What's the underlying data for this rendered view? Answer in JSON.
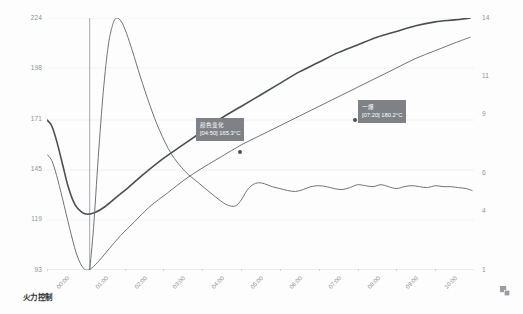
{
  "caption": "火力控制",
  "corner_icon": "expand-icon",
  "annotations": [
    {
      "name": "color-change",
      "title": "颜色变化",
      "value": "[04:50] 165.3°C",
      "time": "04:50",
      "temp_c": 165.3,
      "x_px": 196,
      "y_px": 118,
      "dot_x_px": 240,
      "dot_y_px": 152
    },
    {
      "name": "first-crack",
      "title": "一爆",
      "value": "[07:20] 180.2°C",
      "time": "07:20",
      "temp_c": 180.2,
      "x_px": 358,
      "y_px": 100,
      "dot_x_px": 355,
      "dot_y_px": 120
    }
  ],
  "colors": {
    "background": "#fdfdfd",
    "grid": "#ececec",
    "axis_text": "#8d9196",
    "tooltip_bg": "#7e8287",
    "tooltip_text": "#ffffff",
    "series_env": "#4b4f54",
    "series_bean": "#6f7479",
    "series_ror": "#6f7479",
    "marker": "#4b4f54"
  },
  "chart_data": {
    "type": "line",
    "title": "",
    "subtitle": "",
    "xlabel": "",
    "ylabel": "",
    "grid": true,
    "legend_position": "none",
    "x_ticks": [
      "00:00",
      "01:00",
      "02:00",
      "03:00",
      "04:00",
      "05:00",
      "06:00",
      "07:00",
      "08:00",
      "09:00",
      "10:00"
    ],
    "x_range_minutes": [
      0,
      11
    ],
    "y_left_ticks": [
      93,
      119,
      145,
      171,
      198,
      224
    ],
    "y_left_label": "温度 (°C)",
    "y_left_range": [
      93,
      224
    ],
    "y_right_ticks": [
      1,
      4,
      6,
      9,
      11,
      14
    ],
    "y_right_label": "升温速率 (°C/min)",
    "y_right_range": [
      1,
      14
    ],
    "series": [
      {
        "name": "环境温度",
        "axis": "left",
        "color": "#4b4f54",
        "width": 1.6,
        "points": [
          [
            0.0,
            171
          ],
          [
            0.12,
            168
          ],
          [
            0.25,
            160
          ],
          [
            0.4,
            148
          ],
          [
            0.55,
            136
          ],
          [
            0.72,
            127
          ],
          [
            0.9,
            123
          ],
          [
            1.05,
            122
          ],
          [
            1.25,
            123
          ],
          [
            1.5,
            126
          ],
          [
            1.8,
            131
          ],
          [
            2.1,
            136
          ],
          [
            2.5,
            143
          ],
          [
            3.0,
            151
          ],
          [
            3.5,
            158
          ],
          [
            4.0,
            165
          ],
          [
            4.5,
            172
          ],
          [
            5.0,
            178
          ],
          [
            5.5,
            184
          ],
          [
            6.0,
            190
          ],
          [
            6.5,
            196
          ],
          [
            7.0,
            201
          ],
          [
            7.5,
            206
          ],
          [
            8.0,
            210
          ],
          [
            8.5,
            214
          ],
          [
            9.0,
            217
          ],
          [
            9.5,
            220
          ],
          [
            10.0,
            222
          ],
          [
            10.5,
            223
          ],
          [
            10.9,
            224
          ]
        ]
      },
      {
        "name": "豆温",
        "axis": "left",
        "color": "#6f7479",
        "width": 1.0,
        "points": [
          [
            0.0,
            153
          ],
          [
            0.12,
            150
          ],
          [
            0.25,
            142
          ],
          [
            0.4,
            130
          ],
          [
            0.58,
            115
          ],
          [
            0.75,
            102
          ],
          [
            0.9,
            95
          ],
          [
            1.02,
            93
          ],
          [
            1.15,
            94
          ],
          [
            1.35,
            98
          ],
          [
            1.6,
            104
          ],
          [
            1.9,
            111
          ],
          [
            2.25,
            118
          ],
          [
            2.65,
            126
          ],
          [
            3.1,
            133
          ],
          [
            3.55,
            140
          ],
          [
            4.0,
            146
          ],
          [
            4.5,
            152
          ],
          [
            5.0,
            158
          ],
          [
            5.5,
            163
          ],
          [
            6.0,
            168
          ],
          [
            6.5,
            173
          ],
          [
            7.0,
            178
          ],
          [
            7.5,
            183
          ],
          [
            8.0,
            188
          ],
          [
            8.5,
            193
          ],
          [
            9.0,
            198
          ],
          [
            9.5,
            203
          ],
          [
            10.0,
            207
          ],
          [
            10.5,
            211
          ],
          [
            10.9,
            214
          ]
        ]
      },
      {
        "name": "升温速率",
        "axis": "right",
        "color": "#6f7479",
        "width": 1.0,
        "points": [
          [
            1.1,
            1.0
          ],
          [
            1.2,
            3.2
          ],
          [
            1.32,
            6.8
          ],
          [
            1.45,
            10.2
          ],
          [
            1.58,
            12.6
          ],
          [
            1.7,
            13.7
          ],
          [
            1.8,
            14.0
          ],
          [
            1.92,
            13.8
          ],
          [
            2.05,
            13.2
          ],
          [
            2.2,
            12.3
          ],
          [
            2.4,
            11.0
          ],
          [
            2.65,
            9.5
          ],
          [
            2.9,
            8.2
          ],
          [
            3.2,
            7.0
          ],
          [
            3.55,
            6.1
          ],
          [
            3.9,
            5.5
          ],
          [
            4.2,
            5.0
          ],
          [
            4.45,
            4.6
          ],
          [
            4.65,
            4.35
          ],
          [
            4.85,
            4.3
          ],
          [
            5.0,
            4.6
          ],
          [
            5.15,
            5.1
          ],
          [
            5.3,
            5.4
          ],
          [
            5.45,
            5.5
          ],
          [
            5.6,
            5.45
          ],
          [
            5.8,
            5.3
          ],
          [
            6.0,
            5.2
          ],
          [
            6.2,
            5.1
          ],
          [
            6.4,
            5.05
          ],
          [
            6.6,
            5.15
          ],
          [
            6.8,
            5.3
          ],
          [
            7.0,
            5.35
          ],
          [
            7.2,
            5.3
          ],
          [
            7.4,
            5.2
          ],
          [
            7.6,
            5.15
          ],
          [
            7.8,
            5.25
          ],
          [
            8.0,
            5.4
          ],
          [
            8.2,
            5.35
          ],
          [
            8.4,
            5.3
          ],
          [
            8.6,
            5.4
          ],
          [
            8.8,
            5.3
          ],
          [
            9.0,
            5.2
          ],
          [
            9.2,
            5.3
          ],
          [
            9.4,
            5.35
          ],
          [
            9.6,
            5.3
          ],
          [
            9.8,
            5.25
          ],
          [
            10.0,
            5.35
          ],
          [
            10.2,
            5.3
          ],
          [
            10.4,
            5.3
          ],
          [
            10.6,
            5.25
          ],
          [
            10.8,
            5.2
          ],
          [
            10.95,
            5.1
          ]
        ]
      }
    ],
    "vertical_marker_lines": [
      {
        "name": "charge-line",
        "x_minutes": 1.1
      }
    ]
  }
}
